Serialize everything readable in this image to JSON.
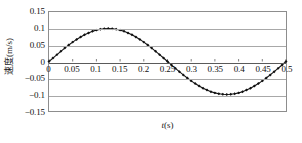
{
  "chart_data": {
    "type": "line",
    "title": "",
    "xlabel": "t(s)",
    "ylabel": "速度(m/s)",
    "xlim": [
      0,
      0.5
    ],
    "ylim": [
      -0.15,
      0.15
    ],
    "grid": true,
    "legend": "none",
    "marker": "diamond",
    "line_color": "#111111",
    "marker_color": "#111111",
    "grid_color": "#a8a8a8",
    "frame_color": "#8d8d8d",
    "background": "#ffffff",
    "xticks": [
      0,
      0.05,
      0.1,
      0.15,
      0.2,
      0.25,
      0.3,
      0.35,
      0.4,
      0.45,
      0.5
    ],
    "xticklabels": [
      "0",
      "0.05",
      "0.1",
      "0.15",
      "0.2",
      "0.25",
      "0.3",
      "0.35",
      "0.4",
      "0.45",
      "0.5"
    ],
    "yticks": [
      0.15,
      0.1,
      0.05,
      0,
      -0.05,
      -0.1,
      -0.15
    ],
    "yticklabels": [
      "0.15",
      "0.1",
      "0.05",
      "0",
      "−0.05",
      "−0.1",
      "−0.15"
    ],
    "amplitude": 0.1,
    "period": 0.5,
    "series": [
      {
        "name": "速度",
        "x": [
          0,
          0.0083,
          0.0167,
          0.025,
          0.0333,
          0.0417,
          0.05,
          0.0583,
          0.0667,
          0.075,
          0.0833,
          0.0917,
          0.1,
          0.1083,
          0.1167,
          0.125,
          0.1333,
          0.1417,
          0.15,
          0.1583,
          0.1667,
          0.175,
          0.1833,
          0.1917,
          0.2,
          0.2083,
          0.2167,
          0.225,
          0.2333,
          0.2417,
          0.25,
          0.2583,
          0.2667,
          0.275,
          0.2833,
          0.2917,
          0.3,
          0.3083,
          0.3167,
          0.325,
          0.3333,
          0.3417,
          0.35,
          0.3583,
          0.3667,
          0.375,
          0.3833,
          0.3917,
          0.4,
          0.4083,
          0.4167,
          0.425,
          0.4333,
          0.4417,
          0.45,
          0.4583,
          0.4667,
          0.475,
          0.4833,
          0.4917,
          0.5
        ],
        "y": [
          0,
          0.0105,
          0.0208,
          0.0309,
          0.0407,
          0.05,
          0.0588,
          0.0669,
          0.0743,
          0.0809,
          0.0866,
          0.0914,
          0.0951,
          0.0978,
          0.0995,
          0.1,
          0.0995,
          0.0978,
          0.0951,
          0.0914,
          0.0866,
          0.0809,
          0.0743,
          0.0669,
          0.0588,
          0.05,
          0.0407,
          0.0309,
          0.0208,
          0.0105,
          0,
          -0.0105,
          -0.0208,
          -0.0309,
          -0.0407,
          -0.05,
          -0.0588,
          -0.0669,
          -0.0743,
          -0.0809,
          -0.0866,
          -0.0914,
          -0.0951,
          -0.0978,
          -0.0995,
          -0.1,
          -0.0995,
          -0.0978,
          -0.0951,
          -0.0914,
          -0.0866,
          -0.0809,
          -0.0743,
          -0.0669,
          -0.0588,
          -0.05,
          -0.0407,
          -0.0309,
          -0.0208,
          -0.0105,
          0
        ]
      }
    ]
  }
}
